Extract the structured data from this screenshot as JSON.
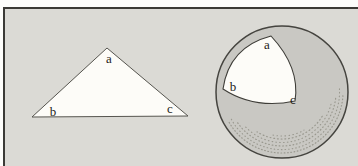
{
  "figure": {
    "plane_triangle": {
      "label_a": "a",
      "label_b": "b",
      "label_c": "c"
    },
    "spherical_triangle": {
      "label_a": "a",
      "label_b": "b",
      "label_c": "c"
    }
  },
  "colors": {
    "page_background": "#fdfdfb",
    "panel_background": "#dbdad5",
    "frame": "#3b3a36",
    "shape_fill": "#fdfcf8",
    "shape_outline": "#4f4e48",
    "sphere_fill": "#c9c8c3",
    "sphere_outline": "#45443f",
    "stipple": "#95948a",
    "label": "#1c1b18"
  }
}
